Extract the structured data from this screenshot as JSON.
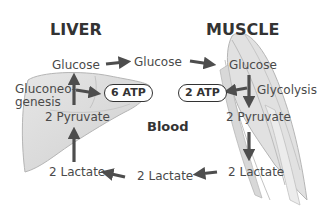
{
  "titles": {
    "liver": "LIVER",
    "muscle": "MUSCLE",
    "blood": "Blood"
  },
  "liver": {
    "glucose": "Glucose",
    "process": "Gluconeo-\ngenesis",
    "process_line1": "Gluconeo-",
    "process_line2": "genesis",
    "atp": "6 ATP",
    "pyruvate": "2 Pyruvate",
    "lactate": "2 Lactate"
  },
  "blood": {
    "glucose": "Glucose",
    "lactate": "2 Lactate"
  },
  "muscle": {
    "glucose": "Glucose",
    "process": "Glycolysis",
    "atp": "2 ATP",
    "pyruvate": "2 Pyruvate",
    "lactate": "2 Lactate"
  },
  "colors": {
    "organ_fill": "#d9d9d9",
    "organ_stroke": "#b0b0b0",
    "arrow": "#4d4d4d",
    "text": "#4a4a4a"
  }
}
